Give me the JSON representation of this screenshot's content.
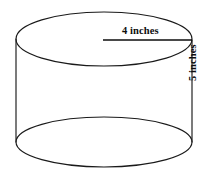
{
  "figure": {
    "type": "geometry-diagram",
    "shape_name": "cylinder",
    "background_color": "#ffffff",
    "stroke_color": "#1a1a1a",
    "text_color": "#0d0d0d",
    "labels": {
      "radius_label": "4 inches",
      "height_label": "5 inches"
    },
    "measurements": [
      {
        "name": "radius",
        "value": 4,
        "unit": "inches",
        "text": "4 inches",
        "orientation": "horizontal"
      },
      {
        "name": "height",
        "value": 5,
        "unit": "inches",
        "text": "5 inches",
        "orientation": "vertical"
      }
    ],
    "geometry": {
      "top_ellipse": {
        "cx": 104,
        "cy": 39,
        "rx": 88,
        "ry": 27
      },
      "bottom_ellipse": {
        "cx": 104,
        "cy": 142,
        "rx": 88,
        "ry": 25
      },
      "left_side": {
        "x": 16,
        "y1": 39,
        "y2": 142
      },
      "right_side": {
        "x": 192,
        "y1": 40,
        "y2": 142
      },
      "radius_line": {
        "x1": 103,
        "x2": 192,
        "y": 40
      }
    }
  }
}
